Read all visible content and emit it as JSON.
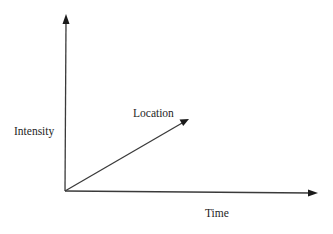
{
  "diagram": {
    "type": "3d-axes",
    "stroke_color": "#3a3a3a",
    "arrow_color": "#1a1a1a",
    "text_color": "#1e1e1e",
    "background": "#ffffff",
    "origin": {
      "x": 65,
      "y": 191
    },
    "axes": [
      {
        "id": "intensity",
        "label": "Intensity",
        "direction": "vertical",
        "end": {
          "x": 66,
          "y": 15
        },
        "label_pos": {
          "x": 14,
          "y": 135
        }
      },
      {
        "id": "time",
        "label": "Time",
        "direction": "horizontal",
        "end": {
          "x": 318,
          "y": 193
        },
        "label_pos": {
          "x": 205,
          "y": 217
        }
      },
      {
        "id": "location",
        "label": "Location",
        "direction": "diagonal",
        "end": {
          "x": 189,
          "y": 119
        },
        "label_pos": {
          "x": 133,
          "y": 117
        }
      }
    ]
  }
}
